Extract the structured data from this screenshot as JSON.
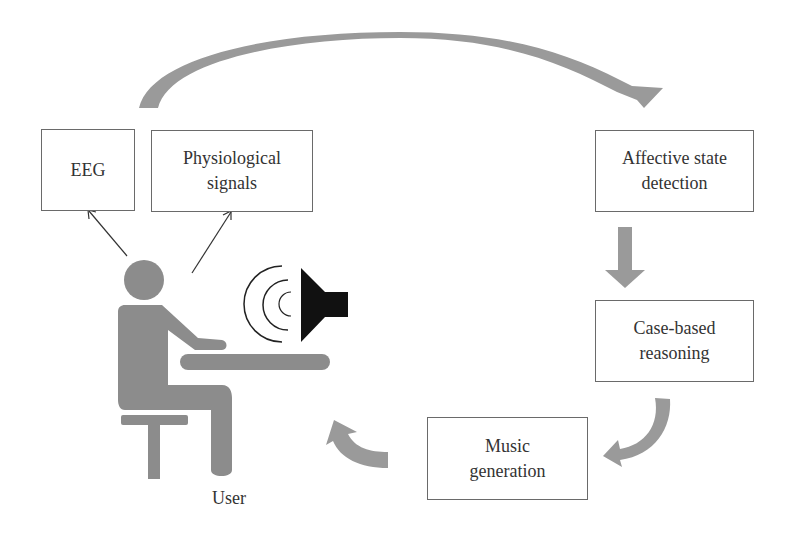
{
  "diagram": {
    "nodes": {
      "eeg": {
        "label": "EEG"
      },
      "physiological": {
        "label_line1": "Physiological",
        "label_line2": "signals"
      },
      "affective": {
        "label_line1": "Affective state",
        "label_line2": "detection"
      },
      "cbr": {
        "label_line1": "Case-based",
        "label_line2": "reasoning"
      },
      "music": {
        "label_line1": "Music",
        "label_line2": "generation"
      }
    },
    "user_label": "User",
    "edges": [
      {
        "from": "user",
        "to": "eeg",
        "style": "thin-arrow"
      },
      {
        "from": "user",
        "to": "physiological",
        "style": "thin-arrow"
      },
      {
        "from": "eeg-physiological",
        "to": "affective",
        "style": "curved-block-arrow"
      },
      {
        "from": "affective",
        "to": "cbr",
        "style": "block-arrow"
      },
      {
        "from": "cbr",
        "to": "music",
        "style": "curved-block-arrow"
      },
      {
        "from": "music",
        "to": "user",
        "style": "curved-block-arrow"
      }
    ],
    "colors": {
      "arrow_fill": "#9a9a9a",
      "figure_fill": "#8c8c8c",
      "speaker_fill": "#111111",
      "box_border": "#6a6a6a"
    }
  }
}
